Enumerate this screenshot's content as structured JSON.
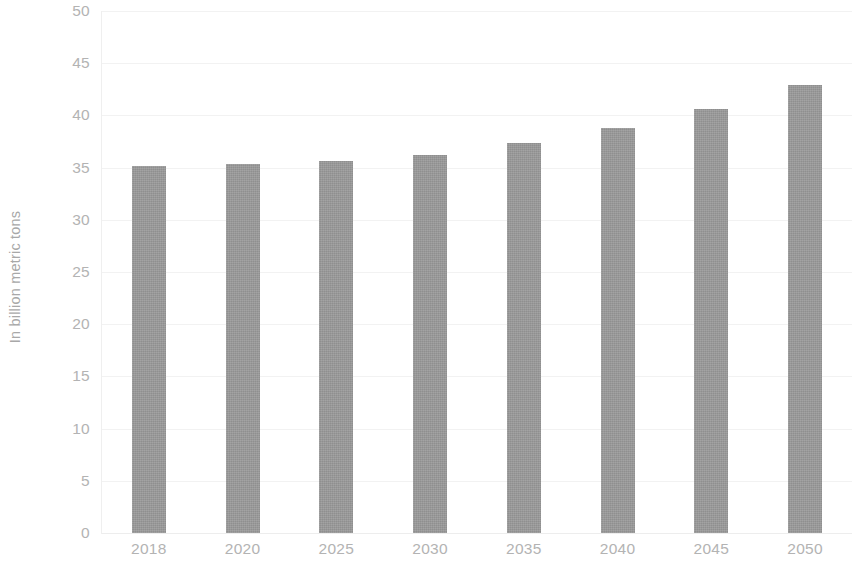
{
  "chart_data": {
    "type": "bar",
    "title": "",
    "subtitle": "",
    "xlabel": "",
    "ylabel": "In billion metric tons",
    "categories": [
      "2018",
      "2020",
      "2025",
      "2030",
      "2035",
      "2040",
      "2045",
      "2050"
    ],
    "values": [
      35.2,
      35.3,
      35.6,
      36.2,
      37.4,
      38.8,
      40.6,
      42.9
    ],
    "series": [
      {
        "name": "",
        "values": [
          35.2,
          35.3,
          35.6,
          36.2,
          37.4,
          38.8,
          40.6,
          42.9
        ]
      }
    ],
    "ylim": [
      0,
      50
    ],
    "y_ticks": [
      0,
      5,
      10,
      15,
      20,
      25,
      30,
      35,
      40,
      45,
      50
    ],
    "y_tick_labels": [
      "0",
      "5",
      "10",
      "15",
      "20",
      "25",
      "30",
      "35",
      "40",
      "45",
      "50"
    ],
    "grid": true,
    "grid_axis": "y",
    "legend": false,
    "legend_position": "none",
    "bar_color": "#999999",
    "tick_label_color": "#b3b3b3",
    "axis_label_color": "#a8a8a8",
    "gridline_color": "#f2f2f2",
    "background_color": "#ffffff",
    "annotations": []
  }
}
